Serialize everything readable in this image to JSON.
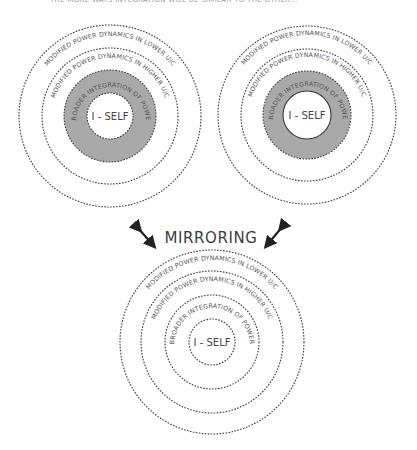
{
  "caption": "THE MORE WAYS INTEGRATION WILL BE SIMILAR TO THE OTHER...",
  "center_label": "MIRRORING",
  "colors": {
    "gray_fill": "#a9a9a9",
    "stroke": "#3a3a3a",
    "text": "#555555"
  },
  "diagrams": [
    {
      "name": "left",
      "rings": {
        "outer": "MODIFIED POWER DYNAMICS IN LOWER U/C",
        "second": "MODIFIED POWER DYNAMICS IN HIGHER U/C",
        "third": "BROADER INTEGRATION OF POWER",
        "core": "I - SELF"
      }
    },
    {
      "name": "right",
      "rings": {
        "outer": "MODIFIED POWER DYNAMICS IN LOWER U/C",
        "second": "MODIFIED POWER DYNAMICS IN HIGHER U/C",
        "third": "BROADER INTEGRATION OF POWER",
        "core": "I - SELF"
      }
    },
    {
      "name": "bottom",
      "rings": {
        "outer": "MODIFIED POWER DYNAMICS IN LOWER U/C",
        "second": "MODIFIED POWER DYNAMICS IN HIGHER U/C",
        "third": "BROADER INTEGRATION OF POWER",
        "core": "I - SELF"
      }
    }
  ],
  "arrows": [
    {
      "name": "left-double-arrow",
      "direction": "diagonal-nw-se"
    },
    {
      "name": "right-double-arrow",
      "direction": "diagonal-ne-sw"
    }
  ]
}
